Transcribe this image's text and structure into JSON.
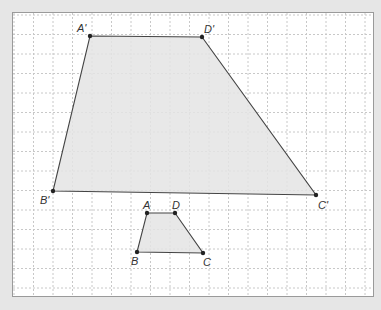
{
  "diagram": {
    "type": "geometry-dilation",
    "colors": {
      "page_background": "#e6e6e6",
      "grid_background": "#ffffff",
      "grid_border": "#9a9a9a",
      "grid_line": "#c8c8c8",
      "shape_fill": "#e4e4e4",
      "shape_stroke": "#444444",
      "vertex": "#222222",
      "label": "#333333"
    },
    "grid": {
      "frame": {
        "x": 12,
        "y": 12,
        "width": 361,
        "height": 284
      },
      "cell_size": 19.5,
      "origin": {
        "x": 14,
        "y": 15
      }
    },
    "shapes": [
      {
        "name": "large-trapezoid",
        "vertices": [
          {
            "label": "A'",
            "x": 90,
            "y": 36,
            "label_x": 77,
            "label_y": 32
          },
          {
            "label": "D'",
            "x": 202,
            "y": 37,
            "label_x": 204,
            "label_y": 33
          },
          {
            "label": "C'",
            "x": 316,
            "y": 195,
            "label_x": 318,
            "label_y": 209
          },
          {
            "label": "B'",
            "x": 53,
            "y": 191,
            "label_x": 40,
            "label_y": 204
          }
        ]
      },
      {
        "name": "small-trapezoid",
        "vertices": [
          {
            "label": "A",
            "x": 147,
            "y": 213,
            "label_x": 143,
            "label_y": 209
          },
          {
            "label": "D",
            "x": 175,
            "y": 213,
            "label_x": 172,
            "label_y": 209
          },
          {
            "label": "C",
            "x": 203,
            "y": 253,
            "label_x": 203,
            "label_y": 266
          },
          {
            "label": "B",
            "x": 137,
            "y": 252,
            "label_x": 131,
            "label_y": 265
          }
        ]
      }
    ]
  }
}
